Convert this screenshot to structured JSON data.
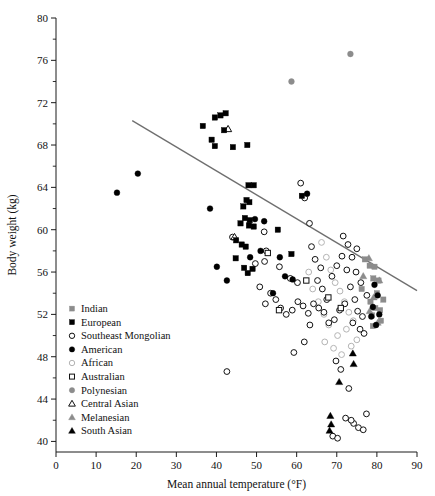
{
  "chart_data": {
    "type": "scatter",
    "title": "",
    "xlabel": "Mean annual temperature (°F)",
    "ylabel": "Body weight (kg)",
    "xlim": [
      0,
      90
    ],
    "ylim": [
      39,
      80
    ],
    "xticks": [
      0,
      10,
      20,
      30,
      40,
      50,
      60,
      70,
      80,
      90
    ],
    "yticks": [
      40,
      44,
      48,
      52,
      56,
      60,
      64,
      68,
      72,
      76,
      80
    ],
    "y_minor_ticks": [
      42,
      46,
      50,
      54,
      58,
      62,
      66,
      70,
      74,
      78
    ],
    "grid": false,
    "legend_position": "inside-left-lower",
    "trendline": {
      "label": "regression line",
      "x1": 19.0,
      "y1": 70.3,
      "x2": 99.5,
      "y2": 52.1,
      "color": "#6f6f6f"
    },
    "marker_styles": {
      "Indian": {
        "shape": "square",
        "fill": "#8c8c8c",
        "stroke": "#8c8c8c",
        "filled": true
      },
      "European": {
        "shape": "square",
        "fill": "#000000",
        "stroke": "#000000",
        "filled": true
      },
      "Southeast Mongolian": {
        "shape": "circle",
        "fill": "none",
        "stroke": "#111111",
        "filled": false
      },
      "American": {
        "shape": "circle",
        "fill": "#000000",
        "stroke": "#000000",
        "filled": true
      },
      "African": {
        "shape": "circle",
        "fill": "none",
        "stroke": "#b4b4b4",
        "filled": false
      },
      "Australian": {
        "shape": "square",
        "fill": "none",
        "stroke": "#111111",
        "filled": false
      },
      "Polynesian": {
        "shape": "circle",
        "fill": "#8c8c8c",
        "stroke": "#8c8c8c",
        "filled": true
      },
      "Central Asian": {
        "shape": "triangle",
        "fill": "none",
        "stroke": "#111111",
        "filled": false
      },
      "Melanesian": {
        "shape": "triangle",
        "fill": "#8c8c8c",
        "stroke": "#8c8c8c",
        "filled": true
      },
      "South Asian": {
        "shape": "triangle",
        "fill": "#000000",
        "stroke": "#000000",
        "filled": true
      }
    },
    "series": [
      {
        "name": "Indian",
        "points": [
          [
            77.0,
            57.2
          ],
          [
            78.2,
            56.6
          ],
          [
            79.4,
            56.5
          ],
          [
            79.1,
            55.4
          ],
          [
            80.4,
            55.2
          ],
          [
            76.2,
            54.4
          ],
          [
            80.0,
            54.0
          ],
          [
            81.6,
            53.4
          ],
          [
            78.4,
            53.2
          ],
          [
            79.6,
            52.6
          ],
          [
            80.8,
            52.4
          ],
          [
            78.8,
            51.9
          ],
          [
            81.0,
            51.4
          ],
          [
            79.0,
            50.9
          ]
        ]
      },
      {
        "name": "European",
        "points": [
          [
            36.6,
            69.8
          ],
          [
            39.6,
            70.6
          ],
          [
            41.0,
            70.8
          ],
          [
            42.3,
            71.0
          ],
          [
            41.9,
            69.4
          ],
          [
            38.8,
            68.5
          ],
          [
            39.6,
            67.9
          ],
          [
            44.1,
            67.8
          ],
          [
            47.7,
            68.0
          ],
          [
            48.0,
            64.2
          ],
          [
            49.3,
            64.2
          ],
          [
            47.5,
            62.8
          ],
          [
            48.2,
            62.6
          ],
          [
            46.7,
            62.2
          ],
          [
            47.1,
            61.1
          ],
          [
            48.3,
            60.9
          ],
          [
            46.0,
            60.6
          ],
          [
            48.1,
            60.4
          ],
          [
            49.3,
            60.3
          ],
          [
            44.9,
            59.0
          ],
          [
            46.3,
            58.6
          ],
          [
            47.3,
            58.4
          ],
          [
            55.3,
            60.0
          ],
          [
            58.7,
            57.7
          ],
          [
            44.8,
            57.3
          ],
          [
            46.9,
            56.4
          ],
          [
            47.8,
            55.9
          ],
          [
            49.0,
            56.3
          ],
          [
            61.3,
            63.2
          ]
        ]
      },
      {
        "name": "Southeast Mongolian",
        "points": [
          [
            44.0,
            59.3
          ],
          [
            51.9,
            59.8
          ],
          [
            52.4,
            58.0
          ],
          [
            52.0,
            57.0
          ],
          [
            49.7,
            56.8
          ],
          [
            55.7,
            56.5
          ],
          [
            58.4,
            55.4
          ],
          [
            60.2,
            55.0
          ],
          [
            61.0,
            64.4
          ],
          [
            62.0,
            63.0
          ],
          [
            63.2,
            60.6
          ],
          [
            63.7,
            58.4
          ],
          [
            64.6,
            57.2
          ],
          [
            66.0,
            56.4
          ],
          [
            65.2,
            55.2
          ],
          [
            66.4,
            54.4
          ],
          [
            67.5,
            53.4
          ],
          [
            68.8,
            55.6
          ],
          [
            70.0,
            56.6
          ],
          [
            71.3,
            57.5
          ],
          [
            72.5,
            56.2
          ],
          [
            73.4,
            54.6
          ],
          [
            72.0,
            53.0
          ],
          [
            70.7,
            52.4
          ],
          [
            69.4,
            51.5
          ],
          [
            68.0,
            51.2
          ],
          [
            66.8,
            52.2
          ],
          [
            65.5,
            52.6
          ],
          [
            64.2,
            53.0
          ],
          [
            62.9,
            52.1
          ],
          [
            61.6,
            52.8
          ],
          [
            60.3,
            53.2
          ],
          [
            58.9,
            52.4
          ],
          [
            57.4,
            52.0
          ],
          [
            56.0,
            52.6
          ],
          [
            54.8,
            53.4
          ],
          [
            53.5,
            54.0
          ],
          [
            52.2,
            53.0
          ],
          [
            50.8,
            54.6
          ],
          [
            42.6,
            46.6
          ],
          [
            59.3,
            48.4
          ],
          [
            61.9,
            49.4
          ],
          [
            63.3,
            51.0
          ],
          [
            74.5,
            53.4
          ],
          [
            75.2,
            52.3
          ],
          [
            76.4,
            51.8
          ],
          [
            74.0,
            51.2
          ],
          [
            75.8,
            50.6
          ],
          [
            76.8,
            50.2
          ],
          [
            77.5,
            53.8
          ],
          [
            76.0,
            55.0
          ],
          [
            74.8,
            56.0
          ],
          [
            73.8,
            57.4
          ],
          [
            75.0,
            58.2
          ],
          [
            72.8,
            58.6
          ],
          [
            71.6,
            59.4
          ],
          [
            69.8,
            47.6
          ],
          [
            71.0,
            46.8
          ],
          [
            73.0,
            45.0
          ],
          [
            74.2,
            41.7
          ],
          [
            75.4,
            41.3
          ],
          [
            76.6,
            41.1
          ],
          [
            77.4,
            42.6
          ],
          [
            69.0,
            40.5
          ],
          [
            70.2,
            40.3
          ],
          [
            72.2,
            42.2
          ],
          [
            73.6,
            42.0
          ]
        ]
      },
      {
        "name": "American",
        "points": [
          [
            15.2,
            63.5
          ],
          [
            20.4,
            65.3
          ],
          [
            38.4,
            62.0
          ],
          [
            40.1,
            56.5
          ],
          [
            42.6,
            55.2
          ],
          [
            49.6,
            61.0
          ],
          [
            51.9,
            60.8
          ],
          [
            55.8,
            57.4
          ],
          [
            57.1,
            55.6
          ],
          [
            62.6,
            63.4
          ],
          [
            59.0,
            55.3
          ],
          [
            54.1,
            54.0
          ],
          [
            79.4,
            54.8
          ],
          [
            80.2,
            53.8
          ],
          [
            79.0,
            52.7
          ],
          [
            80.6,
            52.0
          ],
          [
            78.6,
            51.8
          ],
          [
            79.8,
            51.0
          ],
          [
            51.0,
            58.0
          ],
          [
            48.4,
            57.4
          ]
        ]
      },
      {
        "name": "African",
        "points": [
          [
            66.2,
            58.8
          ],
          [
            67.4,
            57.4
          ],
          [
            68.5,
            56.2
          ],
          [
            69.6,
            55.0
          ],
          [
            70.8,
            54.2
          ],
          [
            71.9,
            53.2
          ],
          [
            73.0,
            52.2
          ],
          [
            74.1,
            51.4
          ],
          [
            72.4,
            50.6
          ],
          [
            70.2,
            50.0
          ],
          [
            68.0,
            51.0
          ],
          [
            66.8,
            52.0
          ],
          [
            65.4,
            53.2
          ],
          [
            64.0,
            54.4
          ],
          [
            67.0,
            49.4
          ],
          [
            69.2,
            48.8
          ],
          [
            71.2,
            48.2
          ],
          [
            73.6,
            49.0
          ],
          [
            75.0,
            49.6
          ],
          [
            63.0,
            56.0
          ]
        ]
      },
      {
        "name": "Australian",
        "points": [
          [
            62.4,
            55.2
          ],
          [
            55.6,
            52.4
          ],
          [
            67.9,
            53.6
          ],
          [
            52.8,
            57.8
          ],
          [
            71.0,
            52.6
          ]
        ]
      },
      {
        "name": "Polynesian",
        "points": [
          [
            58.7,
            74.0
          ],
          [
            73.4,
            76.6
          ]
        ]
      },
      {
        "name": "Central Asian",
        "points": [
          [
            42.9,
            69.5
          ],
          [
            44.5,
            59.3
          ]
        ]
      },
      {
        "name": "Melanesian",
        "points": [
          [
            78.0,
            57.3
          ],
          [
            76.6,
            55.6
          ],
          [
            80.6,
            55.2
          ],
          [
            79.2,
            53.6
          ],
          [
            78.2,
            52.3
          ],
          [
            80.2,
            51.2
          ]
        ]
      },
      {
        "name": "South Asian",
        "points": [
          [
            74.0,
            48.3
          ],
          [
            74.2,
            47.3
          ],
          [
            70.6,
            45.6
          ],
          [
            68.4,
            42.4
          ],
          [
            68.6,
            41.6
          ],
          [
            68.2,
            41.0
          ]
        ]
      }
    ]
  },
  "legend": {
    "items": [
      {
        "label": "Indian",
        "marker": "gray-filled-square"
      },
      {
        "label": "European",
        "marker": "black-filled-square"
      },
      {
        "label": "Southeast Mongolian",
        "marker": "open-circle"
      },
      {
        "label": "American",
        "marker": "black-filled-circle"
      },
      {
        "label": "African",
        "marker": "light-open-circle"
      },
      {
        "label": "Australian",
        "marker": "open-square"
      },
      {
        "label": "Polynesian",
        "marker": "gray-filled-circle"
      },
      {
        "label": "Central Asian",
        "marker": "open-triangle"
      },
      {
        "label": "Melanesian",
        "marker": "gray-filled-triangle"
      },
      {
        "label": "South Asian",
        "marker": "black-filled-triangle"
      }
    ]
  }
}
